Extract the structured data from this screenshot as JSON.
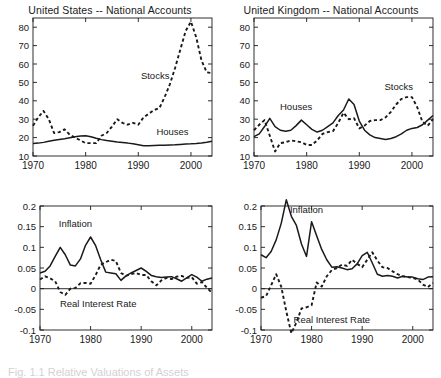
{
  "figure": {
    "width": 441,
    "height": 377,
    "background": "#ffffff",
    "line_color": "#1a1a1a",
    "caption_partial": "Fig. 1.1   Relative Valuations of Assets"
  },
  "chart_data": [
    {
      "id": "us-national-accounts",
      "type": "line",
      "title": "United States -- National Accounts",
      "xlabel": "",
      "ylabel": "",
      "xlim": [
        1970,
        2004
      ],
      "ylim": [
        10,
        85
      ],
      "xticks": [
        1970,
        1980,
        1990,
        2000
      ],
      "yticks": [
        10,
        20,
        30,
        40,
        50,
        60,
        70,
        80
      ],
      "grid": false,
      "legend": "inline-annotations",
      "annotations": [
        {
          "text": "Stocks",
          "x": 1993.2,
          "y": 52
        },
        {
          "text": "Houses",
          "x": 1996.5,
          "y": 21.5
        }
      ],
      "x": [
        1970,
        1971,
        1972,
        1973,
        1974,
        1975,
        1976,
        1977,
        1978,
        1979,
        1980,
        1981,
        1982,
        1983,
        1984,
        1985,
        1986,
        1987,
        1988,
        1989,
        1990,
        1991,
        1992,
        1993,
        1994,
        1995,
        1996,
        1997,
        1998,
        1999,
        2000,
        2001,
        2002,
        2003,
        2004
      ],
      "series": [
        {
          "name": "Houses",
          "style": "solid",
          "values": [
            16.8,
            17.0,
            17.4,
            18.0,
            18.6,
            19.0,
            19.4,
            19.9,
            20.4,
            20.9,
            21.0,
            20.5,
            19.6,
            18.9,
            18.4,
            18.0,
            17.6,
            17.3,
            17.0,
            16.6,
            16.1,
            15.6,
            15.6,
            15.7,
            15.8,
            15.9,
            16.0,
            16.1,
            16.3,
            16.5,
            16.6,
            16.8,
            17.1,
            17.5,
            18.0
          ]
        },
        {
          "name": "Stocks",
          "style": "dashed",
          "values": [
            26.5,
            31.0,
            34.5,
            30.0,
            22.5,
            23.0,
            24.5,
            21.5,
            20.0,
            18.5,
            17.0,
            17.0,
            17.0,
            21.0,
            22.5,
            26.0,
            30.0,
            28.0,
            27.0,
            28.0,
            27.0,
            31.0,
            33.0,
            35.0,
            36.0,
            42.0,
            49.0,
            58.0,
            68.0,
            78.0,
            83.0,
            74.5,
            62.0,
            55.5,
            55.0
          ]
        }
      ]
    },
    {
      "id": "uk-national-accounts",
      "type": "line",
      "title": "United Kingdom -- National Accounts",
      "xlabel": "",
      "ylabel": "",
      "xlim": [
        1970,
        2004
      ],
      "ylim": [
        10,
        85
      ],
      "xticks": [
        1970,
        1980,
        1990,
        2000
      ],
      "yticks": [
        10,
        20,
        30,
        40,
        50,
        60,
        70,
        80
      ],
      "grid": false,
      "legend": "inline-annotations",
      "annotations": [
        {
          "text": "Stocks",
          "x": 1997.5,
          "y": 46
        },
        {
          "text": "Houses",
          "x": 1978.0,
          "y": 35
        }
      ],
      "x": [
        1970,
        1971,
        1972,
        1973,
        1974,
        1975,
        1976,
        1977,
        1978,
        1979,
        1980,
        1981,
        1982,
        1983,
        1984,
        1985,
        1986,
        1987,
        1988,
        1989,
        1990,
        1991,
        1992,
        1993,
        1994,
        1995,
        1996,
        1997,
        1998,
        1999,
        2000,
        2001,
        2002,
        2003,
        2004
      ],
      "series": [
        {
          "name": "Houses",
          "style": "solid",
          "values": [
            20.5,
            22.0,
            26.0,
            30.5,
            26.0,
            24.0,
            23.5,
            24.0,
            26.5,
            29.5,
            27.0,
            24.5,
            23.0,
            24.0,
            26.0,
            28.0,
            32.0,
            35.0,
            41.0,
            38.0,
            29.0,
            24.0,
            21.5,
            20.0,
            19.5,
            19.0,
            19.5,
            20.5,
            22.0,
            24.0,
            25.0,
            25.5,
            27.0,
            29.5,
            32.0
          ]
        },
        {
          "name": "Stocks",
          "style": "dashed",
          "values": [
            24.0,
            27.0,
            29.5,
            21.0,
            12.5,
            17.0,
            17.5,
            18.5,
            18.0,
            17.5,
            16.0,
            16.0,
            18.5,
            22.0,
            23.0,
            23.5,
            28.0,
            33.5,
            30.0,
            30.5,
            25.0,
            26.5,
            29.0,
            29.5,
            29.5,
            31.0,
            34.0,
            38.0,
            41.0,
            42.0,
            42.0,
            36.5,
            28.5,
            26.5,
            30.0
          ]
        }
      ]
    },
    {
      "id": "us-inflation-real-rate",
      "type": "line",
      "title": "",
      "xlabel": "",
      "ylabel": "",
      "xlim": [
        1970,
        2004
      ],
      "ylim": [
        -0.1,
        0.2
      ],
      "xticks": [
        1970,
        1980,
        1990,
        2000
      ],
      "yticks": [
        -0.1,
        -0.05,
        0,
        0.05,
        0.1,
        0.15,
        0.2
      ],
      "grid": false,
      "zero_line": true,
      "legend": "inline-annotations",
      "annotations": [
        {
          "text": "Inflation",
          "x": 1977.0,
          "y": 0.148
        },
        {
          "text": "Real Interest Rate",
          "x": 1981.5,
          "y": -0.045
        }
      ],
      "x": [
        1970,
        1971,
        1972,
        1973,
        1974,
        1975,
        1976,
        1977,
        1978,
        1979,
        1980,
        1981,
        1982,
        1983,
        1984,
        1985,
        1986,
        1987,
        1988,
        1989,
        1990,
        1991,
        1992,
        1993,
        1994,
        1995,
        1996,
        1997,
        1998,
        1999,
        2000,
        2001,
        2002,
        2003,
        2004
      ],
      "series": [
        {
          "name": "Inflation",
          "style": "solid",
          "values": [
            0.038,
            0.042,
            0.055,
            0.078,
            0.1,
            0.082,
            0.057,
            0.055,
            0.072,
            0.105,
            0.125,
            0.104,
            0.07,
            0.04,
            0.038,
            0.036,
            0.02,
            0.031,
            0.038,
            0.044,
            0.05,
            0.042,
            0.032,
            0.029,
            0.027,
            0.028,
            0.029,
            0.024,
            0.018,
            0.026,
            0.034,
            0.028,
            0.018,
            0.023,
            0.026
          ]
        },
        {
          "name": "Real Interest Rate",
          "style": "dashed",
          "values": [
            0.022,
            0.03,
            0.025,
            0.018,
            -0.008,
            -0.015,
            0.0,
            0.002,
            0.013,
            0.014,
            0.012,
            0.033,
            0.058,
            0.064,
            0.07,
            0.067,
            0.038,
            0.031,
            0.035,
            0.038,
            0.033,
            0.033,
            0.018,
            0.008,
            0.02,
            0.026,
            0.023,
            0.029,
            0.031,
            0.026,
            0.028,
            0.012,
            0.016,
            0.002,
            -0.01
          ]
        }
      ]
    },
    {
      "id": "uk-inflation-real-rate",
      "type": "line",
      "title": "",
      "xlabel": "",
      "ylabel": "",
      "xlim": [
        1970,
        2004
      ],
      "ylim": [
        -0.1,
        0.2
      ],
      "xticks": [
        1970,
        1980,
        1990,
        2000
      ],
      "yticks": [
        -0.1,
        -0.05,
        0,
        0.05,
        0.1,
        0.15,
        0.2
      ],
      "grid": false,
      "zero_line": true,
      "legend": "inline-annotations",
      "annotations": [
        {
          "text": "Inflation",
          "x": 1979.0,
          "y": 0.182
        },
        {
          "text": "Real Interest Rate",
          "x": 1984.0,
          "y": -0.082
        }
      ],
      "x": [
        1970,
        1971,
        1972,
        1973,
        1974,
        1975,
        1976,
        1977,
        1978,
        1979,
        1980,
        1981,
        1982,
        1983,
        1984,
        1985,
        1986,
        1987,
        1988,
        1989,
        1990,
        1991,
        1992,
        1993,
        1994,
        1995,
        1996,
        1997,
        1998,
        1999,
        2000,
        2001,
        2002,
        2003,
        2004
      ],
      "series": [
        {
          "name": "Inflation",
          "style": "solid",
          "values": [
            0.082,
            0.075,
            0.09,
            0.118,
            0.158,
            0.215,
            0.175,
            0.153,
            0.108,
            0.078,
            0.162,
            0.128,
            0.095,
            0.07,
            0.052,
            0.053,
            0.05,
            0.046,
            0.048,
            0.06,
            0.08,
            0.088,
            0.062,
            0.035,
            0.03,
            0.032,
            0.03,
            0.026,
            0.03,
            0.028,
            0.028,
            0.024,
            0.022,
            0.028,
            0.029
          ]
        },
        {
          "name": "Real Interest Rate",
          "style": "dashed",
          "values": [
            -0.022,
            -0.018,
            0.008,
            0.035,
            0.005,
            -0.055,
            -0.108,
            -0.082,
            -0.048,
            -0.045,
            -0.04,
            0.015,
            0.005,
            0.03,
            0.045,
            0.05,
            0.058,
            0.055,
            0.07,
            0.06,
            0.052,
            0.07,
            0.088,
            0.068,
            0.052,
            0.05,
            0.042,
            0.035,
            0.03,
            0.028,
            0.026,
            0.022,
            0.01,
            0.004,
            0.014
          ]
        }
      ]
    }
  ]
}
